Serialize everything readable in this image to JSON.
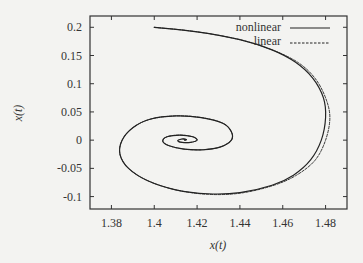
{
  "chart_data": {
    "type": "line",
    "title": "",
    "xlabel": "x(t)",
    "ylabel": "x(t)",
    "xlim": [
      1.37,
      1.49
    ],
    "ylim": [
      -0.122,
      0.22
    ],
    "x_ticks": [
      "1.38",
      "1.4",
      "1.42",
      "1.44",
      "1.46",
      "1.48"
    ],
    "x_tick_values": [
      1.38,
      1.4,
      1.42,
      1.44,
      1.46,
      1.48
    ],
    "y_ticks": [
      "0.2",
      "0.15",
      "0.1",
      "0.05",
      "0",
      "-0.05",
      "-0.1"
    ],
    "y_tick_values": [
      0.2,
      0.15,
      0.1,
      0.05,
      0,
      -0.05,
      -0.1
    ],
    "grid": false,
    "legend_position": "upper right",
    "spiral": {
      "start": [
        1.4,
        0.2
      ],
      "center": [
        1.4142,
        0.0
      ],
      "rightmost_x_nonlinear": 1.48,
      "rightmost_x_linear": 1.482,
      "bottom_y": -0.096,
      "leftmost_x": 1.384,
      "second_top_y": 0.043
    },
    "series": [
      {
        "name": "nonlinear",
        "style": "solid",
        "points": [
          [
            1.4,
            0.2
          ],
          [
            1.42,
            0.192
          ],
          [
            1.44,
            0.178
          ],
          [
            1.455,
            0.16
          ],
          [
            1.466,
            0.138
          ],
          [
            1.474,
            0.11
          ],
          [
            1.479,
            0.075
          ],
          [
            1.48,
            0.04
          ],
          [
            1.478,
            0.0
          ],
          [
            1.473,
            -0.035
          ],
          [
            1.465,
            -0.062
          ],
          [
            1.455,
            -0.08
          ],
          [
            1.44,
            -0.093
          ],
          [
            1.425,
            -0.095
          ],
          [
            1.41,
            -0.088
          ],
          [
            1.397,
            -0.072
          ],
          [
            1.388,
            -0.05
          ],
          [
            1.384,
            -0.025
          ],
          [
            1.385,
            0.0
          ],
          [
            1.39,
            0.022
          ],
          [
            1.398,
            0.037
          ],
          [
            1.41,
            0.043
          ],
          [
            1.422,
            0.04
          ],
          [
            1.432,
            0.03
          ],
          [
            1.436,
            0.015
          ],
          [
            1.436,
            0.0
          ],
          [
            1.431,
            -0.012
          ],
          [
            1.423,
            -0.017
          ],
          [
            1.414,
            -0.016
          ],
          [
            1.407,
            -0.01
          ],
          [
            1.404,
            -0.002
          ],
          [
            1.406,
            0.006
          ],
          [
            1.412,
            0.009
          ],
          [
            1.418,
            0.006
          ],
          [
            1.42,
            0.0
          ],
          [
            1.417,
            -0.004
          ],
          [
            1.413,
            -0.004
          ],
          [
            1.411,
            -0.001
          ],
          [
            1.413,
            0.002
          ],
          [
            1.415,
            0.001
          ],
          [
            1.4142,
            0.0
          ]
        ]
      },
      {
        "name": "linear",
        "style": "dashed",
        "points": [
          [
            1.4,
            0.2
          ],
          [
            1.42,
            0.192
          ],
          [
            1.44,
            0.178
          ],
          [
            1.455,
            0.16
          ],
          [
            1.467,
            0.138
          ],
          [
            1.475,
            0.11
          ],
          [
            1.48,
            0.075
          ],
          [
            1.482,
            0.04
          ],
          [
            1.48,
            0.0
          ],
          [
            1.475,
            -0.036
          ],
          [
            1.466,
            -0.063
          ],
          [
            1.455,
            -0.081
          ],
          [
            1.44,
            -0.094
          ],
          [
            1.425,
            -0.096
          ],
          [
            1.41,
            -0.088
          ],
          [
            1.397,
            -0.072
          ],
          [
            1.388,
            -0.05
          ],
          [
            1.384,
            -0.025
          ],
          [
            1.385,
            0.0
          ],
          [
            1.39,
            0.022
          ],
          [
            1.398,
            0.037
          ],
          [
            1.41,
            0.043
          ],
          [
            1.422,
            0.04
          ],
          [
            1.432,
            0.03
          ],
          [
            1.436,
            0.015
          ],
          [
            1.436,
            0.0
          ],
          [
            1.431,
            -0.012
          ],
          [
            1.423,
            -0.017
          ],
          [
            1.414,
            -0.016
          ],
          [
            1.407,
            -0.01
          ],
          [
            1.404,
            -0.002
          ],
          [
            1.406,
            0.006
          ],
          [
            1.412,
            0.009
          ],
          [
            1.418,
            0.006
          ],
          [
            1.42,
            0.0
          ],
          [
            1.417,
            -0.004
          ],
          [
            1.413,
            -0.004
          ],
          [
            1.411,
            -0.001
          ],
          [
            1.413,
            0.002
          ],
          [
            1.415,
            0.001
          ],
          [
            1.4142,
            0.0
          ]
        ]
      }
    ]
  },
  "legend": {
    "items": [
      {
        "label": "nonlinear",
        "style": "solid"
      },
      {
        "label": "linear",
        "style": "dashed"
      }
    ]
  },
  "colors": {
    "background": "#f3f3f1",
    "line": "#222222",
    "axis": "#333333"
  }
}
